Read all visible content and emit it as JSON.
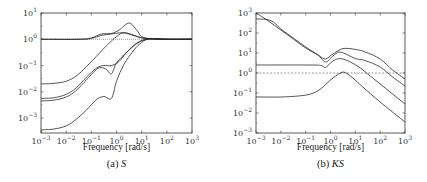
{
  "chart_data": [
    {
      "id": "a",
      "type": "line",
      "title": "",
      "caption_prefix": "(a)",
      "caption_symbol": "S",
      "xlabel": "Frequency [rad/s]",
      "ylabel": "",
      "xscale": "log",
      "yscale": "log",
      "xlim_log10": [
        -3,
        3
      ],
      "ylim_log10": [
        -3.57,
        1
      ],
      "x_ticks_log10": [
        -3,
        -2,
        -1,
        0,
        1,
        2,
        3
      ],
      "y_ticks_log10": [
        -3,
        -2,
        -1,
        0,
        1
      ],
      "grid": false,
      "legend": null,
      "reference_line": {
        "y_log10": 0,
        "style": "dotted"
      },
      "series": [
        {
          "name": "S1",
          "points_log10": [
            [
              -3,
              0
            ],
            [
              -1.5,
              0
            ],
            [
              -1,
              0.05
            ],
            [
              -0.6,
              0.2
            ],
            [
              -0.2,
              0.22
            ],
            [
              0.1,
              0.35
            ],
            [
              0.5,
              0.62
            ],
            [
              0.8,
              0.35
            ],
            [
              1.0,
              0.1
            ],
            [
              1.3,
              0.02
            ],
            [
              1.8,
              0.0
            ],
            [
              3,
              0
            ]
          ]
        },
        {
          "name": "S2",
          "points_log10": [
            [
              -3,
              0
            ],
            [
              -1.5,
              0
            ],
            [
              -1,
              0.03
            ],
            [
              -0.6,
              0.15
            ],
            [
              -0.2,
              0.2
            ],
            [
              0.2,
              0.25
            ],
            [
              0.5,
              0.2
            ],
            [
              0.9,
              0.08
            ],
            [
              1.3,
              0.03
            ],
            [
              2,
              0.0
            ],
            [
              3,
              0
            ]
          ]
        },
        {
          "name": "S3",
          "points_log10": [
            [
              -3,
              -1.7
            ],
            [
              -2.5,
              -1.68
            ],
            [
              -2,
              -1.6
            ],
            [
              -1.6,
              -1.4
            ],
            [
              -1.2,
              -1.05
            ],
            [
              -0.8,
              -0.65
            ],
            [
              -0.4,
              -0.25
            ],
            [
              0,
              0.1
            ],
            [
              0.3,
              0.25
            ],
            [
              0.7,
              0.15
            ],
            [
              1.0,
              0.05
            ],
            [
              1.4,
              0.02
            ],
            [
              2,
              0
            ],
            [
              3,
              0
            ]
          ]
        },
        {
          "name": "S4",
          "points_log10": [
            [
              -3,
              -2.25
            ],
            [
              -2.5,
              -2.23
            ],
            [
              -2,
              -2.1
            ],
            [
              -1.6,
              -1.85
            ],
            [
              -1.2,
              -1.45
            ],
            [
              -0.8,
              -1.1
            ],
            [
              -0.5,
              -1.0
            ],
            [
              -0.2,
              -1.0
            ],
            [
              0.1,
              -0.85
            ],
            [
              0.4,
              -0.5
            ],
            [
              0.8,
              -0.15
            ],
            [
              1.1,
              -0.02
            ],
            [
              1.5,
              0.02
            ],
            [
              2,
              0
            ],
            [
              3,
              0
            ]
          ]
        },
        {
          "name": "S5",
          "points_log10": [
            [
              -3,
              -2.35
            ],
            [
              -2.5,
              -2.32
            ],
            [
              -2,
              -2.2
            ],
            [
              -1.6,
              -1.95
            ],
            [
              -1.2,
              -1.55
            ],
            [
              -0.8,
              -1.15
            ],
            [
              -0.6,
              -1.08
            ],
            [
              -0.4,
              -1.15
            ],
            [
              -0.2,
              -1.32
            ],
            [
              0,
              -0.9
            ],
            [
              0.4,
              -0.5
            ],
            [
              0.8,
              -0.17
            ],
            [
              1.1,
              -0.03
            ],
            [
              1.5,
              0.02
            ],
            [
              2,
              0
            ],
            [
              3,
              0
            ]
          ]
        },
        {
          "name": "S6",
          "points_log10": [
            [
              -3,
              -3.45
            ],
            [
              -2.5,
              -3.42
            ],
            [
              -2,
              -3.3
            ],
            [
              -1.6,
              -3.05
            ],
            [
              -1.2,
              -2.7
            ],
            [
              -0.8,
              -2.3
            ],
            [
              -0.5,
              -2.18
            ],
            [
              -0.2,
              -2.25
            ],
            [
              0,
              -1.6
            ],
            [
              0.3,
              -0.95
            ],
            [
              0.7,
              -0.4
            ],
            [
              1.0,
              -0.12
            ],
            [
              1.3,
              0.02
            ],
            [
              1.8,
              0
            ],
            [
              3,
              0
            ]
          ]
        }
      ]
    },
    {
      "id": "b",
      "type": "line",
      "title": "",
      "caption_prefix": "(b)",
      "caption_symbol": "KS",
      "xlabel": "Frequency [rad/s]",
      "ylabel": "",
      "xscale": "log",
      "yscale": "log",
      "xlim_log10": [
        -3,
        3
      ],
      "ylim_log10": [
        -3,
        3
      ],
      "x_ticks_log10": [
        -3,
        -2,
        -1,
        0,
        1,
        2,
        3
      ],
      "y_ticks_log10": [
        -3,
        -2,
        -1,
        0,
        1,
        2,
        3
      ],
      "grid": false,
      "legend": null,
      "reference_line": {
        "y_log10": 0,
        "style": "dashed"
      },
      "series": [
        {
          "name": "KS1",
          "points_log10": [
            [
              -3,
              3
            ],
            [
              -2.5,
              2.6
            ],
            [
              -2,
              2.15
            ],
            [
              -1.5,
              1.7
            ],
            [
              -1,
              1.25
            ],
            [
              -0.5,
              0.9
            ],
            [
              -0.2,
              0.7
            ],
            [
              0.1,
              0.95
            ],
            [
              0.5,
              1.22
            ],
            [
              1.0,
              1.18
            ],
            [
              1.4,
              1.05
            ],
            [
              2.0,
              0.7
            ],
            [
              2.5,
              0.15
            ],
            [
              3,
              -0.3
            ]
          ]
        },
        {
          "name": "KS2",
          "points_log10": [
            [
              -3,
              2.7
            ],
            [
              -2.6,
              2.68
            ],
            [
              -2.3,
              2.55
            ],
            [
              -2,
              2.2
            ],
            [
              -1.5,
              1.75
            ],
            [
              -1,
              1.3
            ],
            [
              -0.5,
              0.9
            ],
            [
              -0.2,
              0.55
            ],
            [
              0.1,
              0.85
            ],
            [
              0.35,
              1.05
            ],
            [
              0.7,
              0.9
            ],
            [
              1.0,
              0.72
            ],
            [
              1.4,
              0.62
            ],
            [
              2.0,
              0.3
            ],
            [
              2.5,
              -0.2
            ],
            [
              3,
              -0.65
            ]
          ]
        },
        {
          "name": "KS3",
          "points_log10": [
            [
              -3,
              0.4
            ],
            [
              -1,
              0.4
            ],
            [
              -0.4,
              0.38
            ],
            [
              -0.2,
              0.28
            ],
            [
              0.1,
              0.6
            ],
            [
              0.4,
              0.72
            ],
            [
              0.8,
              0.55
            ],
            [
              1.2,
              0.25
            ],
            [
              1.6,
              -0.15
            ],
            [
              2.2,
              -0.75
            ],
            [
              3,
              -1.55
            ]
          ]
        },
        {
          "name": "KS4",
          "points_log10": [
            [
              -3,
              -1.2
            ],
            [
              -2,
              -1.2
            ],
            [
              -1.3,
              -1.15
            ],
            [
              -0.8,
              -1.05
            ],
            [
              -0.4,
              -0.8
            ],
            [
              0,
              -0.35
            ],
            [
              0.4,
              0.0
            ],
            [
              0.6,
              0.02
            ],
            [
              0.9,
              -0.25
            ],
            [
              1.3,
              -0.7
            ],
            [
              2,
              -1.45
            ],
            [
              3,
              -2.45
            ]
          ]
        }
      ]
    }
  ],
  "panels": {
    "a": {
      "caption_prefix": "(a)",
      "caption_symbol": "S",
      "xlabel": "Frequency [rad/s]"
    },
    "b": {
      "caption_prefix": "(b)",
      "caption_symbol": "KS",
      "xlabel": "Frequency [rad/s]"
    }
  },
  "colors": {
    "curve": "#2a2a2a",
    "axis": "#333333",
    "reference": "#555555",
    "background": "#ffffff"
  }
}
